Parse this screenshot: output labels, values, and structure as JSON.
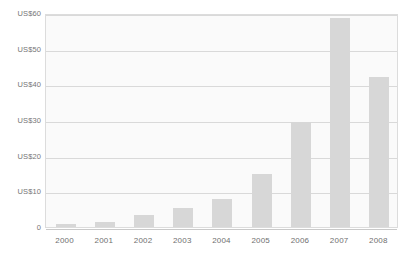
{
  "chart_data": {
    "type": "bar",
    "title": "",
    "xlabel": "",
    "ylabel": "",
    "categories": [
      "2000",
      "2001",
      "2002",
      "2003",
      "2004",
      "2005",
      "2006",
      "2007",
      "2008"
    ],
    "values": [
      0.8,
      1.5,
      3.5,
      5.3,
      7.8,
      15.0,
      29.5,
      58.5,
      42.0
    ],
    "series": [
      {
        "name": "",
        "values": [
          0.8,
          1.5,
          3.5,
          5.3,
          7.8,
          15.0,
          29.5,
          58.5,
          42.0
        ]
      }
    ],
    "ylim": [
      0,
      60
    ],
    "y_ticks": [
      0,
      10,
      20,
      30,
      40,
      50,
      60
    ],
    "y_tick_labels": [
      "0",
      "US$10",
      "US$20",
      "US$30",
      "US$40",
      "US$50",
      "US$60"
    ],
    "x_tick_labels": [
      "2000",
      "2001",
      "2002",
      "2003",
      "2004",
      "2005",
      "2006",
      "2007",
      "2008"
    ],
    "grid": true,
    "grid_axis": "y",
    "legend": false,
    "legend_position": "none",
    "bar_color": "#d7d7d7",
    "plot_background": "#fafafa",
    "grid_color": "#d9d9d9",
    "axis_color": "#dcdcdc",
    "tick_text_color": "#6f6f6f",
    "annotations": []
  },
  "axes": {
    "y_labels": [
      {
        "text": "US$60",
        "value": 60
      },
      {
        "text": "US$50",
        "value": 50
      },
      {
        "text": "US$40",
        "value": 40
      },
      {
        "text": "US$30",
        "value": 30
      },
      {
        "text": "US$20",
        "value": 20
      },
      {
        "text": "US$10",
        "value": 10
      },
      {
        "text": "0",
        "value": 0
      }
    ],
    "x_labels": [
      {
        "text": "2000"
      },
      {
        "text": "2001"
      },
      {
        "text": "2002"
      },
      {
        "text": "2003"
      },
      {
        "text": "2004"
      },
      {
        "text": "2005"
      },
      {
        "text": "2006"
      },
      {
        "text": "2007"
      },
      {
        "text": "2008"
      }
    ]
  },
  "title_clip": {
    "text": "tt"
  }
}
